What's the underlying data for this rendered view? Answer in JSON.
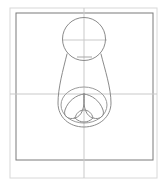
{
  "document": {
    "title": "Technical Line Drawing",
    "background_color": "#ffffff",
    "width": 163,
    "height": 188
  },
  "colors": {
    "outer_frame_stroke": "#d8d8d8",
    "inner_frame_stroke": "#7a7a7a",
    "construction_line_stroke": "#c9c9c9",
    "object_outline_stroke": "#8b8b8b",
    "detail_outline_stroke": "#8b8b8b",
    "canvas_background": "#ffffff"
  },
  "frames": {
    "outer_frame": {
      "name": "outer-sheet-border",
      "x": 10,
      "y": 8,
      "width": 147,
      "height": 170,
      "stroke_width": 1
    },
    "inner_frame": {
      "name": "inner-drawing-border",
      "x": 16,
      "y": 13,
      "width": 137,
      "height": 147,
      "stroke_width": 1
    }
  },
  "construction_lines": {
    "vertical_centerline": {
      "name": "vertical-centerline",
      "x": 84,
      "y1": 8,
      "y2": 178,
      "stroke_width": 1
    },
    "horizontal_centerline": {
      "name": "horizontal-centerline",
      "y": 94,
      "x1": 10,
      "x2": 157,
      "stroke_width": 1
    },
    "head_horizontal_axis": {
      "name": "head-horizontal-axis",
      "y": 40,
      "x1": 62,
      "x2": 107,
      "stroke_width": 1
    },
    "neck_tangent": {
      "name": "neck-tangent-line",
      "y": 57,
      "x1": 77,
      "x2": 92,
      "stroke_width": 1
    }
  },
  "shapes": {
    "head_circle": {
      "name": "head-circle",
      "cx": 84,
      "cy": 39,
      "r": 21.5,
      "stroke_width": 1
    },
    "body_outline": {
      "name": "body-outline",
      "description": "flared vase body from neck under circle widening to rounded base",
      "path": "M 67 54 C 63 70, 58 88, 58 103 C 58 117, 69 127, 84 127 C 99 127, 111 117, 111 103 C 111 88, 105 70, 101 54",
      "stroke_width": 1
    },
    "detail_ellipse": {
      "name": "detail-ellipse-outline",
      "cx": 84,
      "cy": 105,
      "rx": 23,
      "ry": 18,
      "stroke_width": 1
    },
    "lobe_left": {
      "name": "detail-lobe-left",
      "path": "M 84 94 C 76 95, 68 101, 65 110 C 63 116, 68 120, 75 118 C 82 116, 85 108, 84 94 Z",
      "stroke_width": 1
    },
    "lobe_right": {
      "name": "detail-lobe-right",
      "path": "M 84 94 C 92 95, 100 101, 103 110 C 105 116, 100 120, 93 118 C 86 116, 83 108, 84 94 Z",
      "stroke_width": 1
    },
    "lobe_bottom": {
      "name": "detail-lobe-bottom",
      "path": "M 75 118 C 78 121, 81 122, 84 122 C 87 122, 90 121, 93 118 C 92 113, 88 110, 84 110 C 80 110, 76 113, 75 118 Z",
      "stroke_width": 1
    }
  },
  "labels": {
    "caption": ""
  }
}
